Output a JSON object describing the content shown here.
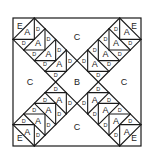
{
  "diagram": {
    "type": "quilt-block-piecing-diagram",
    "line_color": "#1a1a1a",
    "background": "#ffffff",
    "pieces": {
      "center": "B",
      "side": "C",
      "corner": "E",
      "goose": "A",
      "sky": "D"
    },
    "layout": {
      "arms": 4,
      "geese_per_arm": 4,
      "side_regions": [
        "top",
        "left",
        "right",
        "bottom"
      ],
      "corner_regions": [
        "top-left",
        "top-right",
        "bottom-left",
        "bottom-right"
      ]
    }
  }
}
